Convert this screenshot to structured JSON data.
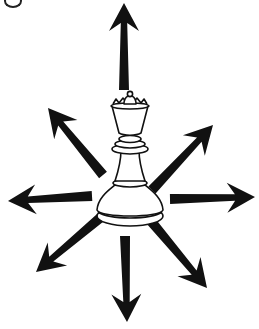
{
  "diagram": {
    "piece": {
      "name": "queen",
      "color": "white",
      "outline_color": "#111111",
      "fill_color": "#ffffff"
    },
    "arrow_color": "#111111",
    "background": "#ffffff",
    "arrows": [
      {
        "direction": "north",
        "base": [
          124,
          90
        ],
        "tip": [
          124,
          3
        ]
      },
      {
        "direction": "north-east",
        "base": [
          152,
          190
        ],
        "tip": [
          213,
          125
        ]
      },
      {
        "direction": "east",
        "base": [
          170,
          199
        ],
        "tip": [
          255,
          197
        ]
      },
      {
        "direction": "south-east",
        "base": [
          150,
          220
        ],
        "tip": [
          207,
          288
        ]
      },
      {
        "direction": "south",
        "base": [
          125,
          236
        ],
        "tip": [
          127,
          322
        ]
      },
      {
        "direction": "south-west",
        "base": [
          100,
          218
        ],
        "tip": [
          36,
          272
        ]
      },
      {
        "direction": "west",
        "base": [
          92,
          196
        ],
        "tip": [
          8,
          201
        ]
      },
      {
        "direction": "north-west",
        "base": [
          103,
          175
        ],
        "tip": [
          48,
          108
        ]
      }
    ]
  }
}
